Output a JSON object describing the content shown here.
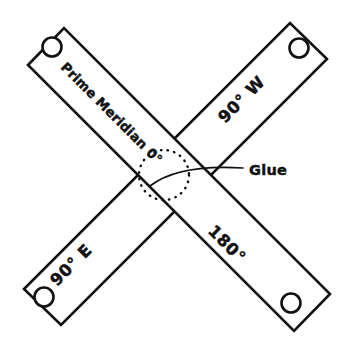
{
  "figure": {
    "background_color": "#ffffff",
    "ink_color": "#111111",
    "width": 351,
    "height": 353
  },
  "strips": [
    {
      "id": "strip-prime-meridian",
      "label": "Prime Meridian 0°",
      "orientation": "top-left to bottom-right",
      "rotation_deg": 45,
      "holes": 2
    },
    {
      "id": "strip-ninety-west-east",
      "label_top": "90° W",
      "label_bottom": "90° E",
      "orientation": "bottom-left to top-right",
      "rotation_deg": -45,
      "holes": 2
    }
  ],
  "labels": {
    "prime_meridian": "Prime Meridian 0°",
    "ninety_west": "90° W",
    "ninety_east": "90° E",
    "one_eighty": "180°",
    "glue": "Glue"
  },
  "annotation": {
    "glue_label": "Glue",
    "glue_marker": "dotted-circle",
    "glue_marker_center": {
      "x": 164,
      "y": 175
    },
    "glue_marker_radius": 25,
    "leader_from": {
      "x": 150,
      "y": 186
    },
    "leader_to": {
      "x": 243,
      "y": 168
    }
  },
  "holes": [
    {
      "name": "hole-top-left",
      "x": 52,
      "y": 47
    },
    {
      "name": "hole-top-right",
      "x": 299,
      "y": 48
    },
    {
      "name": "hole-bottom-left",
      "x": 44,
      "y": 297
    },
    {
      "name": "hole-bottom-right",
      "x": 291,
      "y": 303
    }
  ]
}
